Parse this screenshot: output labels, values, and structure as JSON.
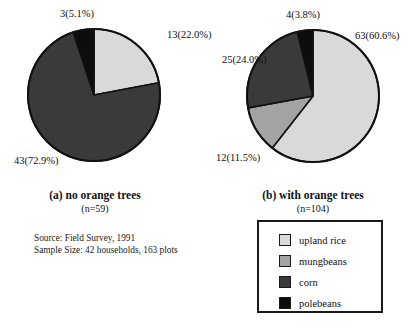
{
  "chart_data": [
    {
      "type": "pie",
      "id": "pie-a",
      "title": "(a) no orange trees",
      "subtitle": "(n=59)",
      "total": 59,
      "center": [
        94,
        95
      ],
      "radius": 66,
      "start_angle_deg": 0,
      "categories": [
        "upland rice",
        "corn",
        "polebeans"
      ],
      "values": [
        13,
        43,
        3
      ],
      "percents": [
        22.0,
        72.9,
        5.1
      ],
      "colors": [
        "#d9d9d9",
        "#3a3a3a",
        "#0d0d0d"
      ],
      "labels": [
        "13(22.0%)",
        "43(72.9%)",
        "3(5.1%)"
      ],
      "label_positions": [
        [
          167,
          29
        ],
        [
          14,
          155
        ],
        [
          60,
          8
        ]
      ]
    },
    {
      "type": "pie",
      "id": "pie-b",
      "title": "(b) with orange trees",
      "subtitle": "(n=104)",
      "total": 104,
      "center": [
        313,
        96
      ],
      "radius": 66,
      "start_angle_deg": 0,
      "categories": [
        "upland rice",
        "mungbeans",
        "corn",
        "polebeans"
      ],
      "values": [
        63,
        12,
        25,
        4
      ],
      "percents": [
        60.6,
        11.5,
        24.0,
        3.8
      ],
      "colors": [
        "#d9d9d9",
        "#a3a3a3",
        "#3a3a3a",
        "#0d0d0d"
      ],
      "labels": [
        "63(60.6%)",
        "12(11.5%)",
        "25(24.0%)",
        "4(3.8%)"
      ],
      "label_positions": [
        [
          355,
          30
        ],
        [
          216,
          152
        ],
        [
          222,
          54
        ],
        [
          286,
          9
        ]
      ]
    }
  ],
  "captions": {
    "a_title": "(a) no orange trees",
    "a_sub": "(n=59)",
    "b_title": "(b) with orange trees",
    "b_sub": "(n=104)"
  },
  "source": {
    "line1": "Source: Field Survey, 1991",
    "line2": "Sample Size: 42 households, 163 plots"
  },
  "legend": {
    "items": [
      {
        "label": "upland rice",
        "color": "#d9d9d9"
      },
      {
        "label": "mungbeans",
        "color": "#a3a3a3"
      },
      {
        "label": "corn",
        "color": "#3a3a3a"
      },
      {
        "label": "polebeans",
        "color": "#0d0d0d"
      }
    ]
  },
  "palette": {
    "upland_rice": "#d9d9d9",
    "mungbeans": "#a3a3a3",
    "corn": "#3a3a3a",
    "polebeans": "#0d0d0d",
    "outline": "#111111",
    "background": "#ffffff"
  }
}
